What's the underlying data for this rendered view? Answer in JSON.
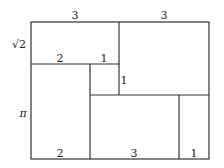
{
  "diagram": {
    "type": "rectangle-dissection",
    "line_color": "#333333",
    "labels": {
      "top_left_width": "3",
      "top_right_width": "3",
      "left_top_height": "√2",
      "left_bottom_height": "π",
      "mid_left_width": "2",
      "mid_small_width": "1",
      "small_square_height": "1",
      "bottom_left_width": "2",
      "bottom_mid_width": "3",
      "bottom_right_width": "1"
    }
  }
}
